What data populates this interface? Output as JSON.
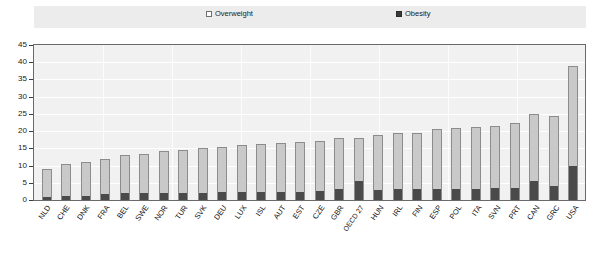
{
  "legend": {
    "overweight_label": "Overweight",
    "obesity_label": "Obesity",
    "overweight_icon": "white-square-icon",
    "obesity_icon": "black-square-icon"
  },
  "axes": {
    "y_ticks": [
      "45",
      "40",
      "35",
      "30",
      "25",
      "20",
      "15",
      "10",
      "5",
      "0"
    ],
    "ylim": [
      0,
      45
    ]
  },
  "colors": {
    "overweight": "#c9c9c9",
    "obesity": "#4a4a4a",
    "plot_background": "#f1f1f1",
    "legend_background": "#ececec",
    "gridline": "#ffffff",
    "axis": "#3b3b3b"
  },
  "chart_data": {
    "type": "bar",
    "title": "",
    "subtitle": "",
    "xlabel": "",
    "ylabel": "",
    "ylim": [
      0,
      45
    ],
    "ytick_step": 5,
    "grid": true,
    "stacked": true,
    "legend_position": "top",
    "categories": [
      "NLD",
      "CHE",
      "DNK",
      "FRA",
      "BEL",
      "SWE",
      "NOR",
      "TUR",
      "SVK",
      "DEU",
      "LUX",
      "ISL",
      "AUT",
      "EST",
      "CZE",
      "GBR",
      "OECD 27",
      "HUN",
      "IRL",
      "FIN",
      "ESP",
      "POL",
      "ITA",
      "SVN",
      "PRT",
      "CAN",
      "GRC",
      "USA"
    ],
    "series": [
      {
        "name": "Obesity",
        "color": "#4a4a4a",
        "values": [
          1.0,
          1.2,
          1.3,
          1.8,
          2.0,
          2.0,
          2.2,
          2.2,
          2.2,
          2.3,
          2.5,
          2.5,
          2.5,
          2.5,
          2.6,
          3.2,
          5.5,
          3.0,
          3.2,
          3.2,
          3.2,
          3.2,
          3.2,
          3.4,
          3.5,
          5.5,
          4.0,
          10.0
        ]
      },
      {
        "name": "Overweight",
        "color": "#c9c9c9",
        "values": [
          8.0,
          9.3,
          9.7,
          10.0,
          11.0,
          11.5,
          12.0,
          12.3,
          12.8,
          13.2,
          13.5,
          13.8,
          14.0,
          14.2,
          14.4,
          14.8,
          12.5,
          16.0,
          16.3,
          16.3,
          17.3,
          17.8,
          18.0,
          18.1,
          19.0,
          19.5,
          20.3,
          29.0
        ]
      }
    ],
    "totals": [
      9.0,
      10.5,
      11.0,
      11.8,
      13.0,
      13.5,
      14.2,
      14.5,
      15.0,
      15.5,
      16.0,
      16.3,
      16.5,
      16.7,
      17.0,
      18.0,
      18.0,
      19.0,
      19.5,
      19.5,
      20.5,
      21.0,
      21.2,
      21.5,
      22.5,
      25.0,
      24.3,
      39.0
    ]
  }
}
